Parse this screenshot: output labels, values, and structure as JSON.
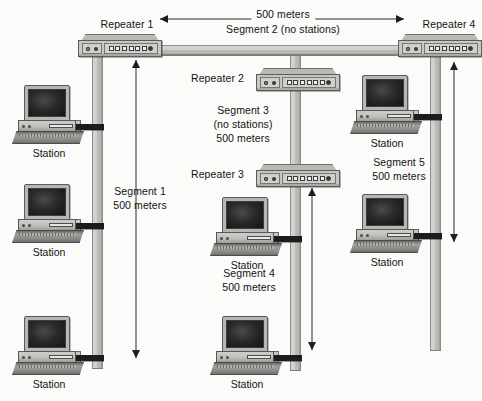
{
  "diagram": {
    "background_color": "#fbfbfa",
    "cable_color": "#c9c9c6",
    "tap_color": "#1c1c1c"
  },
  "repeaters": [
    {
      "id": "repeater-1",
      "label": "Repeater 1",
      "leds": 2,
      "square_ports": 6,
      "round_ports": 1
    },
    {
      "id": "repeater-2",
      "label": "Repeater 2",
      "leds": 2,
      "square_ports": 6,
      "round_ports": 1
    },
    {
      "id": "repeater-3",
      "label": "Repeater 3",
      "leds": 2,
      "square_ports": 6,
      "round_ports": 1
    },
    {
      "id": "repeater-4",
      "label": "Repeater 4",
      "leds": 2,
      "square_ports": 6,
      "round_ports": 1
    }
  ],
  "segments": [
    {
      "id": "segment-1",
      "name": "Segment 1",
      "length": "500 meters",
      "stations": 3,
      "note": ""
    },
    {
      "id": "segment-2",
      "name": "Segment 2 (no stations)",
      "length": "500 meters",
      "stations": 0,
      "note": "no stations"
    },
    {
      "id": "segment-3",
      "name": "Segment 3",
      "length": "500 meters",
      "stations": 0,
      "note": "(no stations)"
    },
    {
      "id": "segment-4",
      "name": "Segment 4",
      "length": "500 meters",
      "stations": 2,
      "note": ""
    },
    {
      "id": "segment-5",
      "name": "Segment 5",
      "length": "500 meters",
      "stations": 2,
      "note": ""
    }
  ],
  "labels": {
    "seg2_length": "500 meters",
    "seg2_name": "Segment 2 (no stations)",
    "seg1_name": "Segment 1",
    "seg1_length": "500 meters",
    "seg3_name": "Segment 3",
    "seg3_note": "(no stations)",
    "seg3_length": "500 meters",
    "seg4_name": "Segment 4",
    "seg4_length": "500 meters",
    "seg5_name": "Segment 5",
    "seg5_length": "500 meters",
    "repeater1": "Repeater 1",
    "repeater2": "Repeater 2",
    "repeater3": "Repeater 3",
    "repeater4": "Repeater 4"
  },
  "stations": [
    {
      "id": "station-s1-a",
      "label": "Station",
      "segment": "Segment 1"
    },
    {
      "id": "station-s1-b",
      "label": "Station",
      "segment": "Segment 1"
    },
    {
      "id": "station-s1-c",
      "label": "Station",
      "segment": "Segment 1"
    },
    {
      "id": "station-s4-a",
      "label": "Station",
      "segment": "Segment 4"
    },
    {
      "id": "station-s4-b",
      "label": "Station",
      "segment": "Segment 4"
    },
    {
      "id": "station-s5-a",
      "label": "Station",
      "segment": "Segment 5"
    },
    {
      "id": "station-s5-b",
      "label": "Station",
      "segment": "Segment 5"
    }
  ]
}
